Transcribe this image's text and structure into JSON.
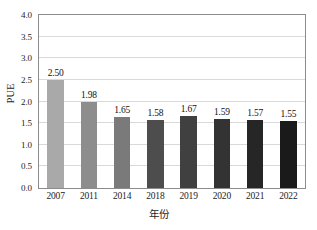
{
  "chart_data": {
    "type": "bar",
    "title": "",
    "subtitle": "",
    "xlabel": "年份",
    "ylabel": "PUE",
    "categories": [
      "2007",
      "2011",
      "2014",
      "2018",
      "2019",
      "2020",
      "2021",
      "2022"
    ],
    "values": [
      2.5,
      1.98,
      1.65,
      1.58,
      1.67,
      1.59,
      1.57,
      1.55
    ],
    "value_labels": [
      "2.50",
      "1.98",
      "1.65",
      "1.58",
      "1.67",
      "1.59",
      "1.57",
      "1.55"
    ],
    "bar_colors": [
      "#a9a9a9",
      "#8d8d8d",
      "#7a7a7a",
      "#4d4d4d",
      "#404040",
      "#333333",
      "#262626",
      "#1a1a1a"
    ],
    "ylim": [
      0.0,
      4.0
    ],
    "y_ticks": [
      0.0,
      0.5,
      1.0,
      1.5,
      2.0,
      2.5,
      3.0,
      3.5,
      4.0
    ],
    "y_tick_labels": [
      "0.0",
      "0.5",
      "1.0",
      "1.5",
      "2.0",
      "2.5",
      "3.0",
      "3.5",
      "4.0"
    ],
    "grid": true,
    "grid_axis": "y",
    "grid_color": "#d9d9d9",
    "legend": false,
    "legend_position": "none",
    "axis_color": "#8c8c8c",
    "background_color": "#ffffff",
    "text_color": "#1c1c1c"
  }
}
